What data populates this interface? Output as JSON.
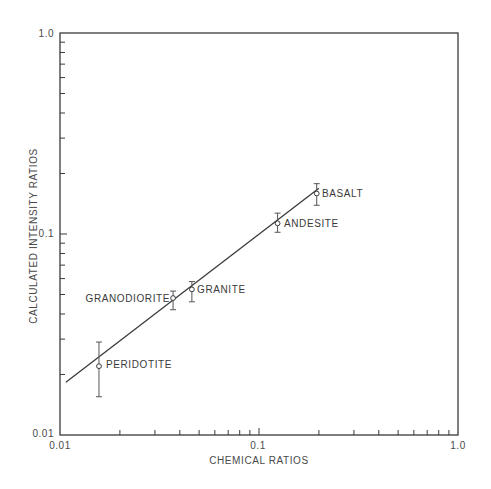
{
  "chart_data": {
    "type": "scatter",
    "title": "",
    "xlabel": "CHEMICAL RATIOS",
    "ylabel": "CALCULATED INTENSITY RATIOS",
    "xscale": "log",
    "yscale": "log",
    "xlim": [
      0.01,
      1.0
    ],
    "ylim": [
      0.01,
      1.0
    ],
    "x_tick_labels": [
      "0.01",
      "0.1",
      "1.0"
    ],
    "y_tick_labels": [
      "0.01",
      "0.1",
      "1.0"
    ],
    "grid": false,
    "legend": null,
    "points": [
      {
        "label": "PERIDOTITE",
        "x": 0.0157,
        "y": 0.022,
        "y_err_low": 0.0155,
        "y_err_high": 0.029
      },
      {
        "label": "GRANODIORITE",
        "x": 0.037,
        "y": 0.048,
        "y_err_low": 0.042,
        "y_err_high": 0.052
      },
      {
        "label": "GRANITE",
        "x": 0.046,
        "y": 0.053,
        "y_err_low": 0.046,
        "y_err_high": 0.058
      },
      {
        "label": "ANDESITE",
        "x": 0.124,
        "y": 0.113,
        "y_err_low": 0.102,
        "y_err_high": 0.127
      },
      {
        "label": "BASALT",
        "x": 0.195,
        "y": 0.159,
        "y_err_low": 0.139,
        "y_err_high": 0.178
      }
    ],
    "fit_line": {
      "x": [
        0.0107,
        0.2
      ],
      "y": [
        0.0183,
        0.169
      ]
    }
  },
  "axes": {
    "xlabel": "CHEMICAL RATIOS",
    "ylabel": "CALCULATED INTENSITY RATIOS",
    "x_ticks": [
      "0.01",
      "0.1",
      "1.0"
    ],
    "y_ticks": [
      "0.01",
      "0.1",
      "1.0"
    ]
  },
  "labels": {
    "peridotite": "PERIDOTITE",
    "granodiorite": "GRANODIORITE",
    "granite": "GRANITE",
    "andesite": "ANDESITE",
    "basalt": "BASALT"
  },
  "colors": {
    "ink": "#3a3a3a",
    "background": "#ffffff"
  }
}
